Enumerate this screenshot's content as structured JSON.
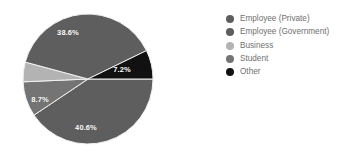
{
  "chart_data": {
    "type": "pie",
    "title": "",
    "subtitle": "",
    "xlabel": "",
    "ylabel": "",
    "grid": false,
    "legend_position": "right",
    "categories": [
      "Employee (Private)",
      "Employee (Government)",
      "Business",
      "Student",
      "Other"
    ],
    "values": [
      40.6,
      38.6,
      4.9,
      8.7,
      7.2
    ],
    "value_labels": [
      "40.6%",
      "38.6%",
      "",
      "8.7%",
      "7.2%"
    ],
    "colors": [
      "#5e5e5e",
      "#5e5e5e",
      "#b3b3b3",
      "#747474",
      "#111111"
    ],
    "units": "percent",
    "slices": [
      {
        "name": "Employee (Private)",
        "value": 40.6,
        "label": "40.6%",
        "color": "#5e5e5e",
        "start_angle": 0,
        "sweep_angle": 146.2,
        "label_visible": true,
        "label_x": 86,
        "label_y": 127
      },
      {
        "name": "Student",
        "value": 8.7,
        "label": "8.7%",
        "color": "#747474",
        "start_angle": 146.2,
        "sweep_angle": 31.3,
        "label_visible": true,
        "label_x": 40,
        "label_y": 99
      },
      {
        "name": "Business",
        "value": 4.9,
        "label": "",
        "color": "#b3b3b3",
        "start_angle": 177.5,
        "sweep_angle": 17.6,
        "label_visible": false,
        "label_x": 0,
        "label_y": 0
      },
      {
        "name": "Employee (Government)",
        "value": 38.6,
        "label": "38.6%",
        "color": "#5e5e5e",
        "start_angle": 195.1,
        "sweep_angle": 139.0,
        "label_visible": true,
        "label_x": 68,
        "label_y": 32
      },
      {
        "name": "Other",
        "value": 7.2,
        "label": "7.2%",
        "color": "#111111",
        "start_angle": 334.1,
        "sweep_angle": 25.9,
        "label_visible": true,
        "label_x": 122,
        "label_y": 69
      }
    ]
  },
  "legend": {
    "items": [
      {
        "label": "Employee (Private)",
        "color": "#5e5e5e"
      },
      {
        "label": "Employee (Government)",
        "color": "#5e5e5e"
      },
      {
        "label": "Business",
        "color": "#b3b3b3"
      },
      {
        "label": "Student",
        "color": "#747474"
      },
      {
        "label": "Other",
        "color": "#111111"
      }
    ]
  },
  "style": {
    "background": "#ffffff",
    "label_color": "#ffffff",
    "legend_text_color": "#6f6f6f",
    "separator_color": "#f2f2f2"
  },
  "geometry": {
    "center_x": 88,
    "center_y": 79,
    "radius": 65
  }
}
